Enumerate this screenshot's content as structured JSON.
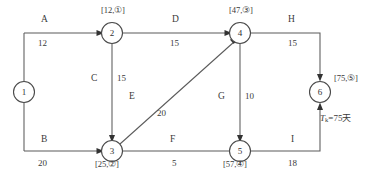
{
  "diagram": {
    "type": "activity-on-arrow-network",
    "title_text": "",
    "nodes": [
      {
        "id": "1",
        "label": "1",
        "event_label": "",
        "cx": 24,
        "cy": 92
      },
      {
        "id": "2",
        "label": "2",
        "event_label": "[12,①]",
        "cx": 112,
        "cy": 33
      },
      {
        "id": "3",
        "label": "3",
        "event_label": "[25,②]",
        "cx": 112,
        "cy": 151
      },
      {
        "id": "4",
        "label": "4",
        "event_label": "[47,③]",
        "cx": 240,
        "cy": 33
      },
      {
        "id": "5",
        "label": "5",
        "event_label": "[57,④]",
        "cx": 240,
        "cy": 151
      },
      {
        "id": "6",
        "label": "6",
        "event_label": "[75,⑤]",
        "cx": 320,
        "cy": 92
      }
    ],
    "edges": [
      {
        "id": "A",
        "activity": "A",
        "duration": "12",
        "from": "1",
        "to": "2"
      },
      {
        "id": "B",
        "activity": "B",
        "duration": "20",
        "from": "1",
        "to": "3"
      },
      {
        "id": "C",
        "activity": "C",
        "duration": "15",
        "from": "2",
        "to": "3"
      },
      {
        "id": "D",
        "activity": "D",
        "duration": "15",
        "from": "2",
        "to": "4"
      },
      {
        "id": "E",
        "activity": "E",
        "duration": "20",
        "from": "3",
        "to": "4"
      },
      {
        "id": "F",
        "activity": "F",
        "duration": "5",
        "from": "3",
        "to": "5"
      },
      {
        "id": "G",
        "activity": "G",
        "duration": "10",
        "from": "4",
        "to": "5"
      },
      {
        "id": "H",
        "activity": "H",
        "duration": "15",
        "from": "4",
        "to": "6"
      },
      {
        "id": "I",
        "activity": "I",
        "duration": "18",
        "from": "5",
        "to": "6"
      }
    ],
    "annotation": {
      "tk_symbol": "T",
      "tk_subscript": "k",
      "tk_value": "=75天"
    },
    "colors": {
      "line": "#5a5a5a",
      "text": "#3a3a3a",
      "background": "#ffffff"
    }
  }
}
